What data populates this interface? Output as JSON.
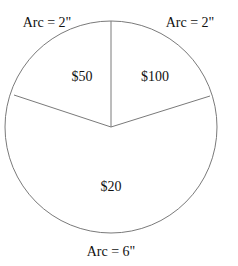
{
  "diagram": {
    "type": "circle-spinner",
    "circle": {
      "cx": 111,
      "cy": 127,
      "r": 106,
      "stroke": "#7a7a7a"
    },
    "sectors": [
      {
        "label": "$50",
        "arc_label": "Arc = 2\""
      },
      {
        "label": "$100",
        "arc_label": "Arc = 2\""
      },
      {
        "label": "$20",
        "arc_label": "Arc = 6\""
      }
    ]
  }
}
